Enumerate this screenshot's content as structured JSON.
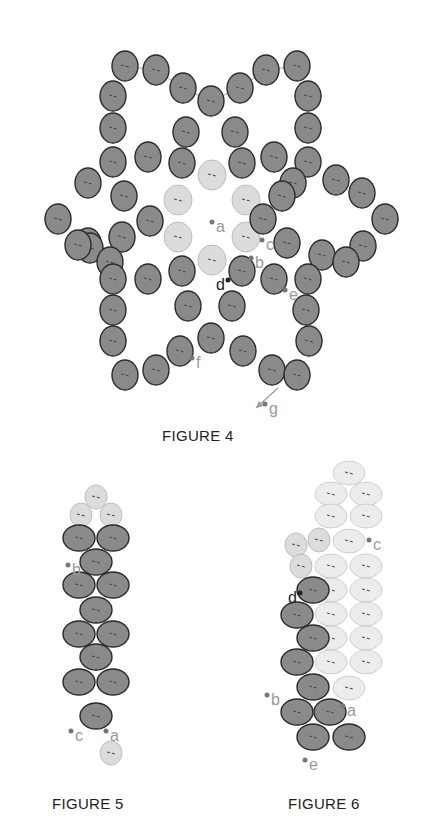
{
  "colors": {
    "bead_dark_fill": "#8a8a8a",
    "bead_dark_stroke": "#2a2a2a",
    "bead_light_fill": "#dcdcdc",
    "bead_light_stroke": "#bdbdbd",
    "bead_pale_fill": "#ececec",
    "bead_pale_stroke": "#d0d0d0",
    "thread": "#555555",
    "thread_light": "#a8a8a8",
    "label_gray": "#9a9a9a",
    "label_dark": "#222222"
  },
  "figures": [
    {
      "id": "figure-4",
      "caption": "FIGURE 4",
      "labels": [
        {
          "text": "a",
          "x": 216,
          "y": 232,
          "tone": "gray"
        },
        {
          "text": "b",
          "x": 255,
          "y": 268,
          "tone": "gray"
        },
        {
          "text": "c",
          "x": 266,
          "y": 250,
          "tone": "gray"
        },
        {
          "text": "d",
          "x": 216,
          "y": 290,
          "tone": "dark"
        },
        {
          "text": "e",
          "x": 289,
          "y": 300,
          "tone": "gray"
        },
        {
          "text": "f",
          "x": 196,
          "y": 368,
          "tone": "gray"
        },
        {
          "text": "g",
          "x": 269,
          "y": 414,
          "tone": "gray"
        }
      ],
      "light_beads": [
        [
          212,
          175
        ],
        [
          178,
          200
        ],
        [
          246,
          200
        ],
        [
          178,
          237
        ],
        [
          246,
          237
        ],
        [
          212,
          260
        ]
      ],
      "dark_beads": [
        [
          125,
          66
        ],
        [
          156,
          70
        ],
        [
          183,
          88
        ],
        [
          211,
          101
        ],
        [
          240,
          88
        ],
        [
          266,
          70
        ],
        [
          297,
          66
        ],
        [
          113,
          96
        ],
        [
          113,
          128
        ],
        [
          308,
          96
        ],
        [
          308,
          128
        ],
        [
          186,
          132
        ],
        [
          235,
          132
        ],
        [
          113,
          162
        ],
        [
          148,
          157
        ],
        [
          182,
          163
        ],
        [
          242,
          163
        ],
        [
          274,
          157
        ],
        [
          308,
          162
        ],
        [
          88,
          183
        ],
        [
          124,
          196
        ],
        [
          150,
          221
        ],
        [
          293,
          183
        ],
        [
          282,
          196
        ],
        [
          336,
          180
        ],
        [
          362,
          193
        ],
        [
          58,
          219
        ],
        [
          385,
          219
        ],
        [
          88,
          243
        ],
        [
          122,
          237
        ],
        [
          90,
          248
        ],
        [
          263,
          219
        ],
        [
          287,
          243
        ],
        [
          322,
          255
        ],
        [
          363,
          246
        ],
        [
          110,
          262
        ],
        [
          78,
          245
        ],
        [
          346,
          262
        ],
        [
          113,
          279
        ],
        [
          148,
          279
        ],
        [
          182,
          271
        ],
        [
          242,
          271
        ],
        [
          274,
          279
        ],
        [
          308,
          279
        ],
        [
          113,
          310
        ],
        [
          306,
          310
        ],
        [
          188,
          306
        ],
        [
          232,
          306
        ],
        [
          211,
          338
        ],
        [
          113,
          341
        ],
        [
          180,
          351
        ],
        [
          243,
          351
        ],
        [
          309,
          341
        ],
        [
          125,
          375
        ],
        [
          156,
          370
        ],
        [
          272,
          370
        ],
        [
          297,
          375
        ]
      ],
      "arrow": {
        "from": [
          278,
          388
        ],
        "to": [
          256,
          408
        ]
      }
    },
    {
      "id": "figure-5",
      "caption": "FIGURE 5",
      "labels": [
        {
          "text": "b",
          "x": 72,
          "y": 575,
          "tone": "gray"
        },
        {
          "text": "c",
          "x": 75,
          "y": 741,
          "tone": "gray"
        },
        {
          "text": "a",
          "x": 110,
          "y": 741,
          "tone": "gray"
        }
      ],
      "light_beads": [
        [
          96,
          497
        ],
        [
          81,
          515
        ],
        [
          111,
          515
        ],
        [
          111,
          753
        ]
      ],
      "dark_beads": [
        [
          79,
          538
        ],
        [
          113,
          538
        ],
        [
          96,
          562
        ],
        [
          79,
          585
        ],
        [
          113,
          585
        ],
        [
          96,
          610
        ],
        [
          79,
          634
        ],
        [
          113,
          634
        ],
        [
          96,
          657
        ],
        [
          79,
          682
        ],
        [
          113,
          682
        ],
        [
          96,
          716
        ]
      ]
    },
    {
      "id": "figure-6",
      "caption": "FIGURE 6",
      "labels": [
        {
          "text": "c",
          "x": 373,
          "y": 550,
          "tone": "gray"
        },
        {
          "text": "d",
          "x": 288,
          "y": 603,
          "tone": "dark"
        },
        {
          "text": "b",
          "x": 271,
          "y": 705,
          "tone": "gray"
        },
        {
          "text": "a",
          "x": 347,
          "y": 716,
          "tone": "gray"
        },
        {
          "text": "e",
          "x": 309,
          "y": 770,
          "tone": "gray"
        }
      ],
      "pale_beads": [
        [
          349,
          473
        ],
        [
          331,
          494
        ],
        [
          366,
          494
        ],
        [
          331,
          516
        ],
        [
          366,
          516
        ],
        [
          349,
          541
        ],
        [
          331,
          566
        ],
        [
          366,
          566
        ],
        [
          331,
          590
        ],
        [
          366,
          590
        ],
        [
          331,
          614
        ],
        [
          366,
          614
        ],
        [
          331,
          638
        ],
        [
          366,
          638
        ],
        [
          331,
          662
        ],
        [
          366,
          662
        ],
        [
          349,
          688
        ]
      ],
      "light_beads": [
        [
          296,
          545
        ],
        [
          319,
          540
        ],
        [
          301,
          566
        ]
      ],
      "dark_beads": [
        [
          313,
          590
        ],
        [
          297,
          615
        ],
        [
          313,
          638
        ],
        [
          297,
          662
        ],
        [
          313,
          687
        ],
        [
          297,
          712
        ],
        [
          330,
          712
        ],
        [
          313,
          737
        ],
        [
          349,
          737
        ]
      ]
    }
  ]
}
